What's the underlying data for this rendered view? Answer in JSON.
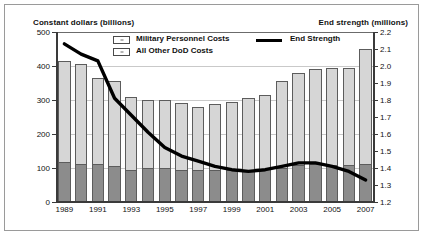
{
  "chart_data": {
    "type": "bar",
    "title": "",
    "axis_titles": {
      "left": "Constant dollars (billions)",
      "right": "End strength (millions)"
    },
    "categories": [
      "1989",
      "1990",
      "1991",
      "1992",
      "1993",
      "1994",
      "1995",
      "1996",
      "1997",
      "1998",
      "1999",
      "2000",
      "2001",
      "2002",
      "2003",
      "2004",
      "2005",
      "2006",
      "2007"
    ],
    "xtick_labels": [
      "1989",
      "1991",
      "1993",
      "1995",
      "1997",
      "1999",
      "2001",
      "2003",
      "2005",
      "2007"
    ],
    "xlabel": "",
    "ylabel": "Constant dollars (billions)",
    "ylim": [
      0,
      500
    ],
    "ytick_labels": [
      "0",
      "100",
      "200",
      "300",
      "400",
      "500"
    ],
    "y2label": "End strength (millions)",
    "y2lim": [
      1.2,
      2.2
    ],
    "y2tick_labels": [
      "1.2",
      "1.3",
      "1.4",
      "1.5",
      "1.6",
      "1.7",
      "1.8",
      "1.9",
      "2.0",
      "2.1",
      "2.2"
    ],
    "grid": true,
    "legend_position": "top-inside",
    "series": [
      {
        "name": "Military Personnel Costs",
        "type": "bar-segment",
        "color": "#8c8c8c",
        "values": [
          118,
          112,
          113,
          107,
          95,
          100,
          100,
          95,
          95,
          95,
          93,
          95,
          97,
          100,
          108,
          112,
          110,
          108,
          112
        ]
      },
      {
        "name": "All Other DoD Costs",
        "type": "bar-segment",
        "color": "#d6d6d6",
        "values": [
          297,
          295,
          252,
          248,
          215,
          200,
          200,
          197,
          185,
          192,
          200,
          212,
          217,
          255,
          272,
          278,
          283,
          287,
          338
        ]
      },
      {
        "name": "End Strength",
        "type": "line",
        "color": "#000000",
        "values": [
          2.13,
          2.07,
          2.03,
          1.81,
          1.71,
          1.61,
          1.52,
          1.47,
          1.44,
          1.41,
          1.39,
          1.38,
          1.39,
          1.41,
          1.43,
          1.43,
          1.41,
          1.38,
          1.33
        ]
      }
    ],
    "totals": [
      415,
      407,
      365,
      355,
      310,
      300,
      300,
      292,
      280,
      287,
      293,
      307,
      314,
      355,
      380,
      390,
      393,
      395,
      450
    ],
    "legend_entries": [
      "Military Personnel Costs",
      "All Other DoD Costs",
      "End Strength"
    ]
  },
  "colors": {
    "military": "#8c8c8c",
    "other": "#d6d6d6",
    "line": "#000000",
    "grid": "#c9c9c9",
    "axis": "#3a3a3a",
    "border": "#9a9a9a"
  }
}
